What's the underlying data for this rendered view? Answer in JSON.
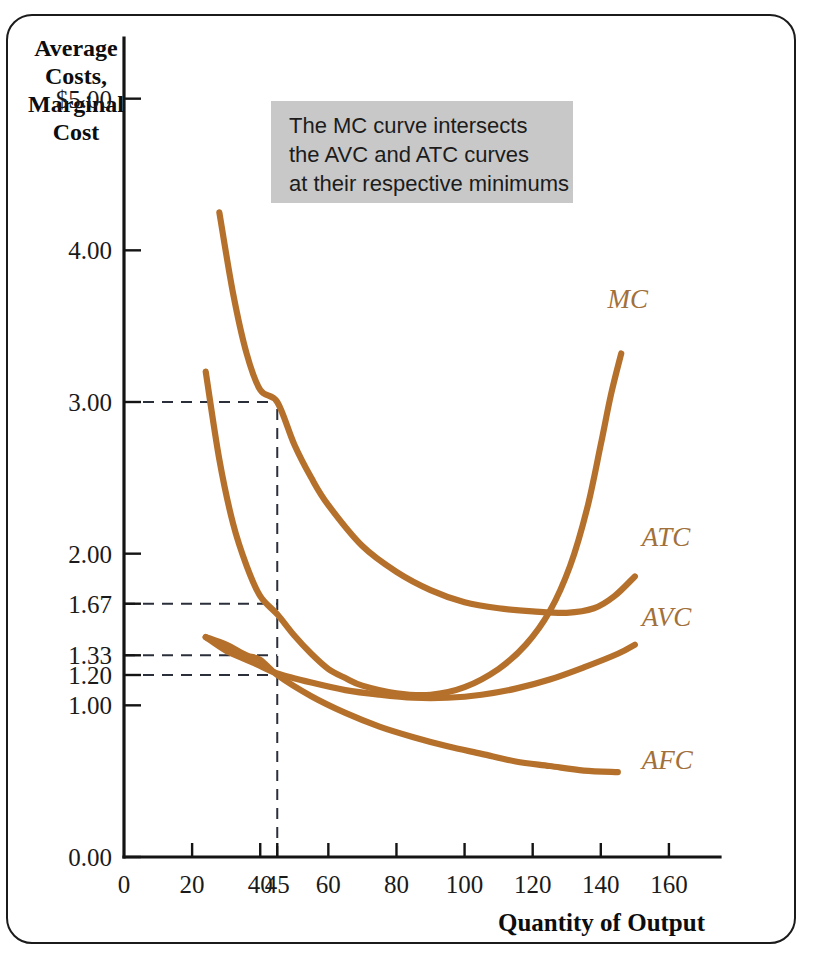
{
  "figure": {
    "background_color": "#ffffff",
    "frame_color": "#1b1b1b",
    "curve_color": "#b5712c",
    "label_color": "#a1703b",
    "note_box_color": "#c8c8c8"
  },
  "annotation": {
    "name": "mc-intersect-note",
    "lines": [
      "The MC curve intersects",
      "the AVC and ATC curves",
      "at their respective minimums"
    ]
  },
  "chart_data": {
    "type": "line",
    "title": "",
    "xlabel": "Quantity of Output",
    "ylabel_lines": [
      "Average",
      "Costs,",
      "Marginal",
      "Cost"
    ],
    "xlim": [
      0,
      175
    ],
    "ylim": [
      0,
      5.4
    ],
    "grid": false,
    "legend": "inline-curve-labels",
    "xticks": [
      0,
      20,
      40,
      45,
      60,
      80,
      100,
      120,
      140,
      160
    ],
    "xtick_labels": [
      "0",
      "20",
      "40",
      "45",
      "60",
      "80",
      "100",
      "120",
      "140",
      "160"
    ],
    "yticks": [
      0.0,
      1.0,
      1.2,
      1.33,
      1.67,
      2.0,
      3.0,
      4.0,
      5.0
    ],
    "ytick_labels": [
      "0.00",
      "1.00",
      "1.20",
      "1.33",
      "1.67",
      "2.00",
      "3.00",
      "4.00",
      "$5.00"
    ],
    "reference_lines": {
      "vertical_x": 45,
      "vertical_y_top": 3.0,
      "horizontal_y": [
        3.0,
        1.67,
        1.33,
        1.2
      ],
      "style": "dashed"
    },
    "series": [
      {
        "name": "MC",
        "label": "MC",
        "label_x": 142,
        "label_y": 3.62,
        "points": [
          [
            24,
            3.2
          ],
          [
            28,
            2.62
          ],
          [
            32,
            2.2
          ],
          [
            36,
            1.92
          ],
          [
            40,
            1.72
          ],
          [
            45,
            1.6
          ],
          [
            50,
            1.46
          ],
          [
            55,
            1.34
          ],
          [
            60,
            1.24
          ],
          [
            65,
            1.18
          ],
          [
            70,
            1.13
          ],
          [
            80,
            1.08
          ],
          [
            90,
            1.07
          ],
          [
            100,
            1.12
          ],
          [
            110,
            1.24
          ],
          [
            118,
            1.4
          ],
          [
            125,
            1.62
          ],
          [
            131,
            1.92
          ],
          [
            136,
            2.3
          ],
          [
            140,
            2.72
          ],
          [
            143,
            3.05
          ],
          [
            146,
            3.32
          ]
        ]
      },
      {
        "name": "ATC",
        "label": "ATC",
        "label_x": 152,
        "label_y": 2.05,
        "points": [
          [
            28,
            4.25
          ],
          [
            32,
            3.72
          ],
          [
            36,
            3.32
          ],
          [
            40,
            3.08
          ],
          [
            45,
            3.0
          ],
          [
            50,
            2.72
          ],
          [
            55,
            2.5
          ],
          [
            60,
            2.32
          ],
          [
            70,
            2.05
          ],
          [
            80,
            1.88
          ],
          [
            90,
            1.76
          ],
          [
            100,
            1.68
          ],
          [
            110,
            1.64
          ],
          [
            120,
            1.62
          ],
          [
            130,
            1.61
          ],
          [
            138,
            1.64
          ],
          [
            144,
            1.72
          ],
          [
            150,
            1.85
          ]
        ]
      },
      {
        "name": "AVC",
        "label": "AVC",
        "label_x": 152,
        "label_y": 1.52,
        "points": [
          [
            24,
            1.45
          ],
          [
            30,
            1.36
          ],
          [
            36,
            1.3
          ],
          [
            40,
            1.26
          ],
          [
            45,
            1.21
          ],
          [
            55,
            1.15
          ],
          [
            65,
            1.1
          ],
          [
            75,
            1.07
          ],
          [
            85,
            1.05
          ],
          [
            95,
            1.05
          ],
          [
            105,
            1.07
          ],
          [
            115,
            1.11
          ],
          [
            125,
            1.17
          ],
          [
            135,
            1.25
          ],
          [
            145,
            1.34
          ],
          [
            150,
            1.4
          ]
        ]
      },
      {
        "name": "AFC",
        "label": "AFC",
        "label_x": 152,
        "label_y": 0.58,
        "points": [
          [
            24,
            1.45
          ],
          [
            30,
            1.4
          ],
          [
            36,
            1.33
          ],
          [
            40,
            1.3
          ],
          [
            45,
            1.2
          ],
          [
            55,
            1.06
          ],
          [
            65,
            0.95
          ],
          [
            75,
            0.86
          ],
          [
            85,
            0.79
          ],
          [
            95,
            0.73
          ],
          [
            105,
            0.68
          ],
          [
            115,
            0.63
          ],
          [
            125,
            0.6
          ],
          [
            135,
            0.57
          ],
          [
            145,
            0.56
          ]
        ]
      }
    ]
  }
}
